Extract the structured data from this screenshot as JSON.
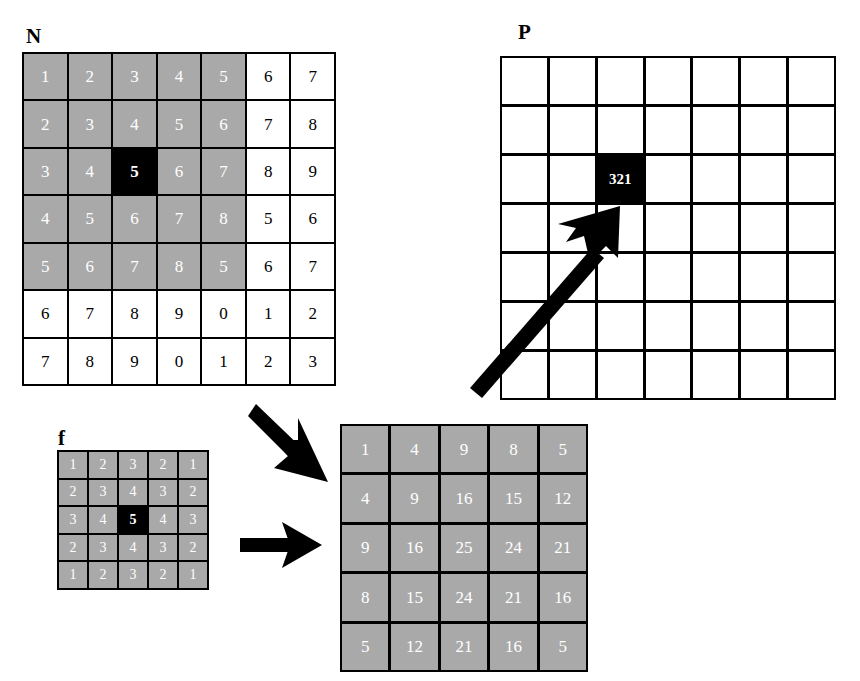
{
  "figure": {
    "labels": {
      "n_matrix": "N",
      "p_matrix": "P",
      "kernel": "f"
    }
  },
  "matrices": {
    "N": {
      "label": "N",
      "rows": 7,
      "cols": 7,
      "values": [
        [
          "1",
          "2",
          "3",
          "4",
          "5",
          "6",
          "7"
        ],
        [
          "2",
          "3",
          "4",
          "5",
          "6",
          "7",
          "8"
        ],
        [
          "3",
          "4",
          "5",
          "6",
          "7",
          "8",
          "9"
        ],
        [
          "4",
          "5",
          "6",
          "7",
          "8",
          "5",
          "6"
        ],
        [
          "5",
          "6",
          "7",
          "8",
          "5",
          "6",
          "7"
        ],
        [
          "6",
          "7",
          "8",
          "9",
          "0",
          "1",
          "2"
        ],
        [
          "7",
          "8",
          "9",
          "0",
          "1",
          "2",
          "3"
        ]
      ],
      "styles": [
        [
          "gray",
          "gray",
          "gray",
          "gray",
          "gray",
          "white",
          "white"
        ],
        [
          "gray",
          "gray",
          "gray",
          "gray",
          "gray",
          "white",
          "white"
        ],
        [
          "gray",
          "gray",
          "black",
          "gray",
          "gray",
          "white",
          "white"
        ],
        [
          "gray",
          "gray",
          "gray",
          "gray",
          "gray",
          "white",
          "white"
        ],
        [
          "gray",
          "gray",
          "gray",
          "gray",
          "gray",
          "white",
          "white"
        ],
        [
          "white",
          "white",
          "white",
          "white",
          "white",
          "white",
          "white"
        ],
        [
          "white",
          "white",
          "white",
          "white",
          "white",
          "white",
          "white"
        ]
      ]
    },
    "P": {
      "label": "P",
      "rows": 7,
      "cols": 7,
      "values": [
        [
          "",
          "",
          "",
          "",
          "",
          "",
          ""
        ],
        [
          "",
          "",
          "",
          "",
          "",
          "",
          ""
        ],
        [
          "",
          "",
          "321",
          "",
          "",
          "",
          ""
        ],
        [
          "",
          "",
          "",
          "",
          "",
          "",
          ""
        ],
        [
          "",
          "",
          "",
          "",
          "",
          "",
          ""
        ],
        [
          "",
          "",
          "",
          "",
          "",
          "",
          ""
        ],
        [
          "",
          "",
          "",
          "",
          "",
          "",
          ""
        ]
      ],
      "styles": [
        [
          "white",
          "white",
          "white",
          "white",
          "white",
          "white",
          "white"
        ],
        [
          "white",
          "white",
          "white",
          "white",
          "white",
          "white",
          "white"
        ],
        [
          "white",
          "white",
          "black",
          "white",
          "white",
          "white",
          "white"
        ],
        [
          "white",
          "white",
          "white",
          "white",
          "white",
          "white",
          "white"
        ],
        [
          "white",
          "white",
          "white",
          "white",
          "white",
          "white",
          "white"
        ],
        [
          "white",
          "white",
          "white",
          "white",
          "white",
          "white",
          "white"
        ],
        [
          "white",
          "white",
          "white",
          "white",
          "white",
          "white",
          "white"
        ]
      ]
    },
    "f": {
      "label": "f",
      "rows": 5,
      "cols": 5,
      "values": [
        [
          "1",
          "2",
          "3",
          "2",
          "1"
        ],
        [
          "2",
          "3",
          "4",
          "3",
          "2"
        ],
        [
          "3",
          "4",
          "5",
          "4",
          "3"
        ],
        [
          "2",
          "3",
          "4",
          "3",
          "2"
        ],
        [
          "1",
          "2",
          "3",
          "2",
          "1"
        ]
      ],
      "styles": [
        [
          "gray",
          "gray",
          "gray",
          "gray",
          "gray"
        ],
        [
          "gray",
          "gray",
          "gray",
          "gray",
          "gray"
        ],
        [
          "gray",
          "gray",
          "black",
          "gray",
          "gray"
        ],
        [
          "gray",
          "gray",
          "gray",
          "gray",
          "gray"
        ],
        [
          "gray",
          "gray",
          "gray",
          "gray",
          "gray"
        ]
      ]
    },
    "result": {
      "label": "",
      "rows": 5,
      "cols": 5,
      "values": [
        [
          "1",
          "4",
          "9",
          "8",
          "5"
        ],
        [
          "4",
          "9",
          "16",
          "15",
          "12"
        ],
        [
          "9",
          "16",
          "25",
          "24",
          "21"
        ],
        [
          "8",
          "15",
          "24",
          "21",
          "16"
        ],
        [
          "5",
          "12",
          "21",
          "16",
          "5"
        ]
      ],
      "styles": [
        [
          "gray",
          "gray",
          "gray",
          "gray",
          "gray"
        ],
        [
          "gray",
          "gray",
          "gray",
          "gray",
          "gray"
        ],
        [
          "gray",
          "gray",
          "gray",
          "gray",
          "gray"
        ],
        [
          "gray",
          "gray",
          "gray",
          "gray",
          "gray"
        ],
        [
          "gray",
          "gray",
          "gray",
          "gray",
          "gray"
        ]
      ]
    }
  },
  "arrows": [
    {
      "name": "diagonal-to-p",
      "direction": "up-right"
    },
    {
      "name": "n-to-result",
      "direction": "down-right"
    },
    {
      "name": "f-to-result",
      "direction": "right"
    }
  ],
  "colors": {
    "gray_cell": "#a9a9a9",
    "black_cell": "#000000",
    "white_cell": "#ffffff",
    "text_on_gray": "#ffffff",
    "text_on_white": "#000000",
    "border": "#000000"
  }
}
